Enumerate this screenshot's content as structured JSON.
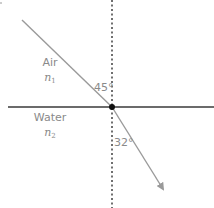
{
  "diagram": {
    "media": {
      "upper": {
        "name": "Air",
        "index_symbol": "n",
        "index_subscript": "1"
      },
      "lower": {
        "name": "Water",
        "index_symbol": "n",
        "index_subscript": "2"
      }
    },
    "angles": {
      "incidence": "45°",
      "refraction": "32°"
    },
    "colors": {
      "interface_line": "#3a3a3a",
      "normal_line": "#333333",
      "ray": "#9a9a9a",
      "point": "#111111",
      "label_text": "#8a8a8a"
    },
    "geometry": {
      "normal_x": 112,
      "interface_y": 107,
      "incident_ray": {
        "x1": 22,
        "y1": 20,
        "x2": 112,
        "y2": 107
      },
      "refracted_ray": {
        "x1": 112,
        "y1": 107,
        "x2": 164,
        "y2": 190
      }
    }
  }
}
